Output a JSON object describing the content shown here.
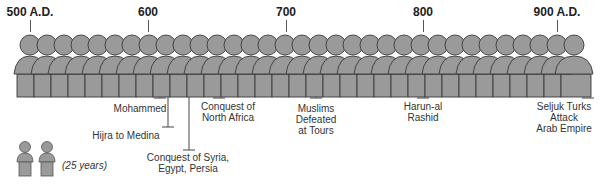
{
  "timeline": {
    "years": [
      {
        "label": "500 A.D.",
        "x": 30
      },
      {
        "label": "600",
        "x": 148
      },
      {
        "label": "700",
        "x": 286
      },
      {
        "label": "800",
        "x": 423
      },
      {
        "label": "900 A.D.",
        "x": 557
      }
    ],
    "figures": {
      "count": 33,
      "start_x": 30,
      "spacing": 17,
      "fill": "#9a9a9a",
      "stroke": "#3a3a3a"
    },
    "events": [
      {
        "label": "Mohammed",
        "x": 160,
        "line_end": 98,
        "label_x": 140,
        "label_y": 103
      },
      {
        "label": "Hijra to Medina",
        "x": 168,
        "line_end": 127,
        "label_x": 126,
        "label_y": 130
      },
      {
        "label": "Conquest of Syria, Egypt, Persia",
        "line1": "Conquest of Syria,",
        "line2": "Egypt, Persia",
        "x": 189,
        "line_end": 150,
        "label_x": 188,
        "label_y": 152
      },
      {
        "label": "Conquest of North Africa",
        "line1": "Conquest of",
        "line2": "North Africa",
        "x": 219,
        "line_end": 97,
        "label_x": 228,
        "label_y": 101
      },
      {
        "label": "Muslims Defeated at Tours",
        "line1": "Muslims",
        "line2": "Defeated",
        "line3": "at Tours",
        "x": 316,
        "line_end": 98,
        "label_x": 316,
        "label_y": 103
      },
      {
        "label": "Harun-al Rashid",
        "line1": "Harun-al",
        "line2": "Rashid",
        "x": 423,
        "line_end": 97,
        "label_x": 423,
        "label_y": 101
      },
      {
        "label": "Seljuk Turks Attack Arab Empire",
        "line1": "Seljuk Turks",
        "line2": "Attack",
        "line3": "Arab Empire",
        "x": 588,
        "line_end": 97,
        "label_x": 564,
        "label_y": 101
      }
    ]
  },
  "legend": {
    "text": "(25 years)"
  }
}
